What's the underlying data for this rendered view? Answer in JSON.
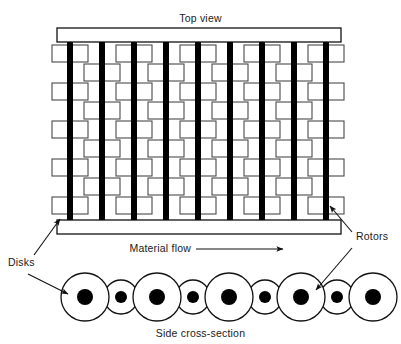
{
  "figure": {
    "type": "technical-diagram",
    "background_color": "#ffffff",
    "line_color": "#111111",
    "fill_color": "#000000",
    "disk_stroke_color": "#4a4a4a"
  },
  "labels": {
    "top_view": "Top view",
    "side_cross_section": "Side cross-section",
    "material_flow": "Material flow",
    "disks": "Disks",
    "rotors": "Rotors"
  },
  "top_view": {
    "frame": {
      "x": 57,
      "y": 28,
      "width": 284,
      "top_bar_height": 14,
      "bottom_bar_y": 220,
      "bottom_bar_height": 14
    },
    "rotor_count": 9,
    "rotor_bar_width": 6,
    "rotor_bar_top": 42,
    "rotor_bar_bottom": 220,
    "rotor_x_centers": [
      70,
      102,
      134,
      166,
      198,
      230,
      262,
      294,
      326
    ],
    "disk_rows": 9,
    "disk_row_y_starts": [
      45,
      64,
      83,
      102,
      121,
      140,
      159,
      178,
      197
    ],
    "disk_width": 36,
    "disk_height": 17,
    "row_a_centers": [
      70,
      134,
      198,
      262,
      326
    ],
    "row_b_centers": [
      102,
      166,
      230,
      294
    ],
    "row_pattern": [
      "A",
      "B",
      "A",
      "B",
      "A",
      "B",
      "A",
      "B",
      "A"
    ]
  },
  "side_cross_section": {
    "circle_count": 9,
    "baseline_y": 297,
    "big_radius": 24,
    "small_radius": 17,
    "hub_radius_big": 8,
    "hub_radius_small": 6,
    "x_centers": [
      85,
      121,
      157,
      193,
      229,
      265,
      301,
      337,
      373
    ],
    "size_pattern": [
      "big",
      "small",
      "big",
      "small",
      "big",
      "small",
      "big",
      "small",
      "big"
    ]
  },
  "annotations": {
    "material_flow_arrow": {
      "from_x": 196,
      "to_x": 283,
      "y": 249
    },
    "disks_label_pos": {
      "x": 8,
      "y": 265
    },
    "rotors_label_pos": {
      "x": 355,
      "y": 238
    },
    "disks_arrows": 2,
    "rotors_arrows": 2
  }
}
